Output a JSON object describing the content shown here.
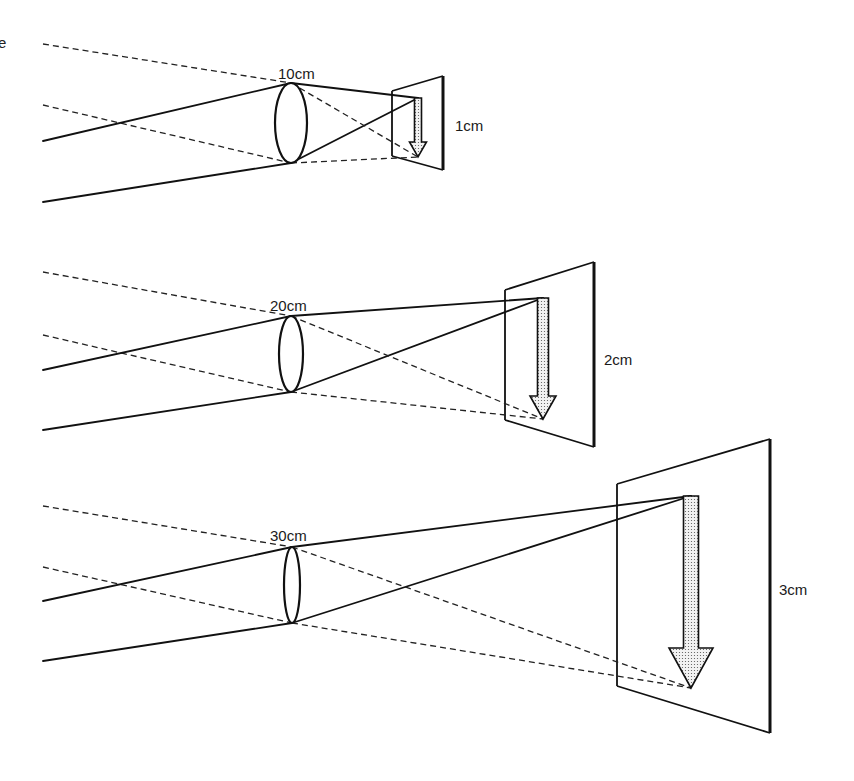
{
  "figure": {
    "type": "optics-diagram",
    "stray_text": "e",
    "colors": {
      "line": "#111111",
      "background": "#ffffff",
      "arrow_fill": "#e6e6e6"
    }
  },
  "panels": [
    {
      "id": "panel-1",
      "distance_label": "10cm",
      "image_size_label": "1cm",
      "lens": {
        "cx": 291,
        "top": 83,
        "bottom": 163,
        "rx": 16
      },
      "rays_left_x": 43,
      "dashed_starts_y": [
        44,
        105
      ],
      "solid_starts_y": [
        141,
        202
      ],
      "screen": {
        "front_x": 392,
        "front_top": 91,
        "front_bottom": 156,
        "back_x": 443,
        "back_top": 76,
        "back_bottom": 170
      },
      "arrow": {
        "x": 418,
        "top": 98,
        "tip": 157,
        "shaft_half": 3.5,
        "head_half": 8.5,
        "head_y": 142
      }
    },
    {
      "id": "panel-2",
      "distance_label": "20cm",
      "image_size_label": "2cm",
      "lens": {
        "cx": 291,
        "top": 316,
        "bottom": 392,
        "rx": 12
      },
      "rays_left_x": 43,
      "dashed_starts_y": [
        272,
        335
      ],
      "solid_starts_y": [
        370,
        430
      ],
      "screen": {
        "front_x": 505,
        "front_top": 290,
        "front_bottom": 420,
        "back_x": 594,
        "back_top": 262,
        "back_bottom": 447
      },
      "arrow": {
        "x": 543,
        "top": 298,
        "tip": 419,
        "shaft_half": 5.5,
        "head_half": 13,
        "head_y": 396
      }
    },
    {
      "id": "panel-3",
      "distance_label": "30cm",
      "image_size_label": "3cm",
      "lens": {
        "cx": 292,
        "top": 547,
        "bottom": 623,
        "rx": 8
      },
      "rays_left_x": 43,
      "dashed_starts_y": [
        506,
        567
      ],
      "solid_starts_y": [
        601,
        661
      ],
      "screen": {
        "front_x": 617,
        "front_top": 484,
        "front_bottom": 686,
        "back_x": 770,
        "back_top": 439,
        "back_bottom": 733
      },
      "arrow": {
        "x": 691,
        "top": 496,
        "tip": 688,
        "shaft_half": 7.5,
        "head_half": 22,
        "head_y": 648
      }
    }
  ]
}
